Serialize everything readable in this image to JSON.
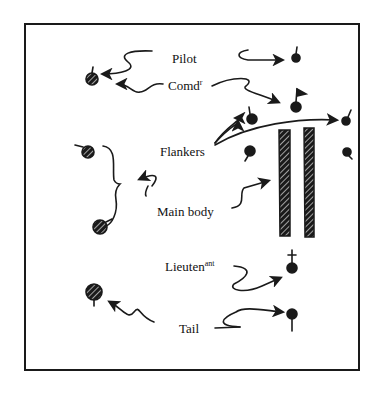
{
  "diagram": {
    "type": "hand-drawn formation sketch",
    "labels": {
      "pilot": {
        "text": "Pilot"
      },
      "commander": {
        "text": "Comd",
        "sup": "r"
      },
      "flankers": {
        "text": "Flankers"
      },
      "main_body": {
        "text": "Main body"
      },
      "lieutenant": {
        "text": "Lieuten",
        "sup": "ant"
      },
      "tail": {
        "text": "Tail"
      }
    },
    "markers": [
      {
        "id": "pilot-marker",
        "x": 296,
        "y": 57,
        "style": "solid-stem-up"
      },
      {
        "id": "commander-marker",
        "x": 296,
        "y": 107,
        "style": "solid-flag"
      },
      {
        "id": "left-pilot-comd-marker",
        "x": 92,
        "y": 78,
        "style": "hatched-stem-up"
      },
      {
        "id": "flanker-left-top",
        "x": 252,
        "y": 120,
        "style": "solid-stem-up"
      },
      {
        "id": "flanker-right-top",
        "x": 346,
        "y": 120,
        "style": "solid-stem-up"
      },
      {
        "id": "flanker-left-bottom",
        "x": 250,
        "y": 153,
        "style": "solid-stem-down"
      },
      {
        "id": "flanker-right-bottom",
        "x": 347,
        "y": 152,
        "style": "solid-stem-down"
      },
      {
        "id": "left-group-top",
        "x": 88,
        "y": 152,
        "style": "hatched-stem-left"
      },
      {
        "id": "left-group-bottom",
        "x": 100,
        "y": 227,
        "style": "hatched-stem-right"
      },
      {
        "id": "lieutenant-marker",
        "x": 292,
        "y": 268,
        "style": "solid-cross"
      },
      {
        "id": "left-tail-marker",
        "x": 94,
        "y": 293,
        "style": "hatched-stem-down"
      },
      {
        "id": "tail-marker",
        "x": 292,
        "y": 314,
        "style": "solid-stem-down"
      }
    ],
    "main_body_columns": 2,
    "colors": {
      "ink": "#1a1a1a",
      "paper": "#ffffff"
    }
  }
}
